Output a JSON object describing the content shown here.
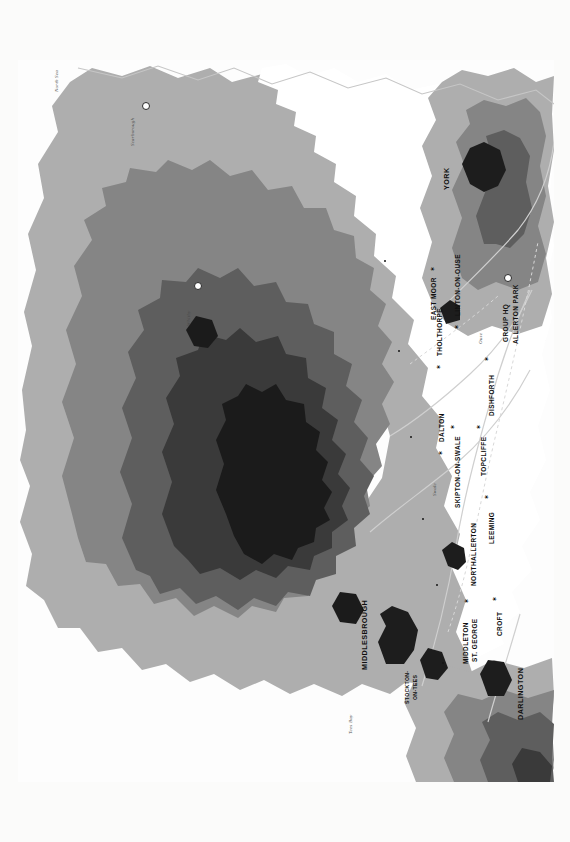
{
  "document": {
    "title": "NO 6 GROUP BASES IN THE VALE OF YORK",
    "type": "historical relief map",
    "orientation": "rotated 90 degrees counter-clockwise on the page"
  },
  "north_arrow": {
    "label": "N",
    "icon": "north-arrow-icon"
  },
  "scale_bar": {
    "miles_unit": "20 mi",
    "km_unit": "30 km",
    "miles_ticks": [
      "0",
      "5",
      "10",
      "15",
      "20"
    ],
    "km_ticks": [
      "0",
      "10",
      "20",
      "30"
    ],
    "caption": "Elevation in feet"
  },
  "legend": {
    "header_feet": "FEET",
    "header_meters": "MET",
    "feet_labels": [
      "2000",
      "1400",
      "1000",
      "600",
      "200",
      "0"
    ],
    "meter_labels": [
      "610",
      "427",
      "305",
      "183",
      "61",
      "0"
    ],
    "bands": [
      {
        "feet": "2000",
        "meters": "610",
        "color": "#1b1b1b"
      },
      {
        "feet": "1400",
        "meters": "427",
        "color": "#3a3a3a"
      },
      {
        "feet": "1000",
        "meters": "305",
        "color": "#5e5e5e"
      },
      {
        "feet": "600",
        "meters": "183",
        "color": "#858585"
      },
      {
        "feet": "200",
        "meters": "61",
        "color": "#aeaeae"
      },
      {
        "feet": "0",
        "meters": "0",
        "color": "#ffffff"
      }
    ]
  },
  "colors": {
    "paper": "#fbfbfa",
    "sea": "#fdfdfd",
    "lowland": "#ffffff",
    "tier1": "#aeaeae",
    "tier2": "#858585",
    "tier3": "#5e5e5e",
    "tier4": "#3a3a3a",
    "tier5": "#1b1b1b",
    "urban": "#1d1d1d",
    "river": "#c9c9c9",
    "boundary": "#d2d2d2",
    "text": "#111111"
  },
  "airfields": [
    {
      "name": "MIDDLETON\nST. GEORGE",
      "marker": "star"
    },
    {
      "name": "CROFT",
      "marker": "star"
    },
    {
      "name": "LEEMING",
      "marker": "star"
    },
    {
      "name": "SKIPTON-ON-SWALE",
      "marker": "star"
    },
    {
      "name": "TOPCLIFFE",
      "marker": "star"
    },
    {
      "name": "DALTON",
      "marker": "star"
    },
    {
      "name": "DISHFORTH",
      "marker": "star"
    },
    {
      "name": "THOLTHORPE",
      "marker": "star"
    },
    {
      "name": "EAST MOOR",
      "marker": "star"
    },
    {
      "name": "LINTON-ON-OUSE",
      "marker": "star"
    }
  ],
  "towns": [
    {
      "name": "MIDDLESBROUGH"
    },
    {
      "name": "STOCKTON-\nON-TEES"
    },
    {
      "name": "DARLINGTON"
    },
    {
      "name": "NORTHALLERTON"
    },
    {
      "name": "YORK"
    },
    {
      "name": "Scarborough"
    },
    {
      "name": "Whitby"
    }
  ],
  "headquarters": {
    "line1": "GROUP HQ",
    "line2": "ALLERTON PARK",
    "marker": "ring"
  },
  "water_labels": [
    {
      "name": "Tees Bay"
    },
    {
      "name": "North Sea"
    },
    {
      "name": "Swale"
    },
    {
      "name": "Ouse"
    },
    {
      "name": "Tees"
    },
    {
      "name": "Ure"
    }
  ],
  "map_labels": {
    "middlesbrough": "MIDDLESBROUGH",
    "stockton_l1": "STOCKTON-",
    "stockton_l2": "ON-TEES",
    "middleton_l1": "MIDDLETON",
    "middleton_l2": "ST. GEORGE",
    "croft": "CROFT",
    "darlington": "DARLINGTON",
    "northallerton": "NORTHALLERTON",
    "leeming": "LEEMING",
    "skipton": "SKIPTON-ON-SWALE",
    "topcliffe": "TOPCLIFFE",
    "dalton": "DALTON",
    "dishforth": "DISHFORTH",
    "tholthorpe": "THOLTHORPE",
    "east_moor": "EAST MOOR",
    "linton": "LINTON-ON-OUSE",
    "group_hq": "GROUP HQ",
    "allerton": "ALLERTON PARK",
    "york": "YORK",
    "scarborough": "Scarborough",
    "whitby": "Whitby",
    "tees_bay": "Tees Bay",
    "north_sea": "North Sea",
    "swale": "Swale",
    "ouse": "Ouse"
  }
}
